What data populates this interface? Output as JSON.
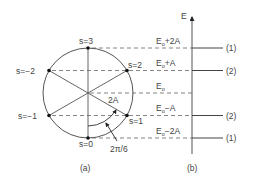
{
  "figure": {
    "panel_a": {
      "caption": "(a)",
      "points": [
        {
          "id": "s3",
          "label": "s=3"
        },
        {
          "id": "s2",
          "label": "s=2"
        },
        {
          "id": "s1",
          "label": "s=1"
        },
        {
          "id": "s0",
          "label": "s=0"
        },
        {
          "id": "sm1",
          "label": "s=−1"
        },
        {
          "id": "sm2",
          "label": "s=−2"
        }
      ],
      "coupling_label": "2A",
      "angle_label": "2π/6"
    },
    "panel_b": {
      "caption": "(b)",
      "axis_label": "E",
      "levels": [
        {
          "base": "E",
          "sub": "o",
          "suffix": "+2A",
          "degeneracy": "(1)"
        },
        {
          "base": "E",
          "sub": "o",
          "suffix": "+A",
          "degeneracy": "(2)"
        },
        {
          "base": "E",
          "sub": "o",
          "suffix": "",
          "degeneracy": ""
        },
        {
          "base": "E",
          "sub": "o",
          "suffix": "−A",
          "degeneracy": "(2)"
        },
        {
          "base": "E",
          "sub": "o",
          "suffix": "−2A",
          "degeneracy": "(1)"
        }
      ]
    },
    "colors": {
      "line": "#555555",
      "dot": "#111111",
      "text": "#444444"
    }
  }
}
